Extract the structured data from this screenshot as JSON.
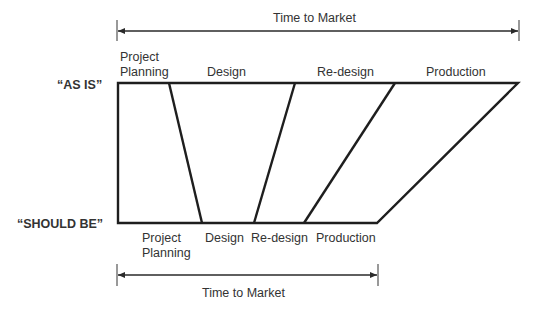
{
  "diagram": {
    "top_span": {
      "label": "Time to Market"
    },
    "bottom_span": {
      "label": "Time to Market"
    },
    "rows": {
      "as_is": {
        "label": "“AS IS”"
      },
      "should_be": {
        "label": "“SHOULD BE”"
      }
    },
    "as_is_phases": [
      {
        "line1": "Project",
        "line2": "Planning"
      },
      {
        "line1": "Design"
      },
      {
        "line1": "Re-design"
      },
      {
        "line1": "Production"
      }
    ],
    "should_be_phases": [
      {
        "line1": "Project",
        "line2": "Planning"
      },
      {
        "line1": "Design"
      },
      {
        "line1": "Re-design"
      },
      {
        "line1": "Production"
      }
    ],
    "colors": {
      "line": "#1e1e1e",
      "text": "#333333",
      "background": "#ffffff"
    }
  }
}
